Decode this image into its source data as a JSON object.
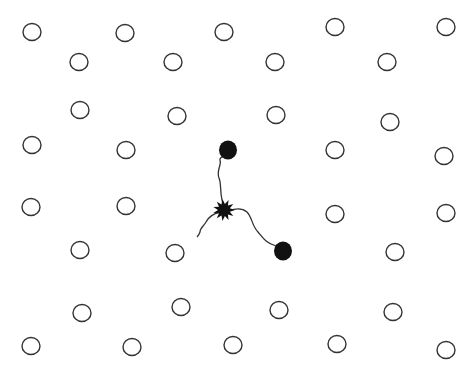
{
  "diagram": {
    "colors": {
      "background": "#ffffff",
      "stroke": "#333333",
      "fill": "#111111"
    },
    "lattice_sites": [
      [
        32,
        32
      ],
      [
        125,
        33
      ],
      [
        224,
        32
      ],
      [
        335,
        27
      ],
      [
        446,
        27
      ],
      [
        79,
        62
      ],
      [
        173,
        62
      ],
      [
        275,
        62
      ],
      [
        387,
        62
      ],
      [
        80,
        110
      ],
      [
        177,
        116
      ],
      [
        276,
        115
      ],
      [
        390,
        122
      ],
      [
        32,
        145
      ],
      [
        126,
        150
      ],
      [
        335,
        150
      ],
      [
        444,
        156
      ],
      [
        31,
        207
      ],
      [
        126,
        206
      ],
      [
        335,
        214
      ],
      [
        446,
        213
      ],
      [
        80,
        250
      ],
      [
        175,
        253
      ],
      [
        395,
        252
      ],
      [
        82,
        313
      ],
      [
        181,
        307
      ],
      [
        279,
        310
      ],
      [
        393,
        312
      ],
      [
        31,
        346
      ],
      [
        132,
        347
      ],
      [
        233,
        345
      ],
      [
        337,
        344
      ],
      [
        446,
        350
      ]
    ],
    "site_radius": 9,
    "displaced_particles": [
      [
        228,
        150
      ],
      [
        283,
        251
      ]
    ],
    "particle_radius": 9,
    "defect_center": [
      224,
      210
    ],
    "tracks": [
      "M224,206 C219,195 222,185 219,178 C216,170 222,165 220,160 C219,156 226,158 227,152",
      "M220,212 C212,214 208,218 206,222 C204,226 200,228 200,232 C199,235 198,236 197,237",
      "M229,211 C236,208 242,208 247,212 C252,217 252,226 258,232 C263,238 266,243 276,246 C279,247 281,249 283,251"
    ]
  }
}
